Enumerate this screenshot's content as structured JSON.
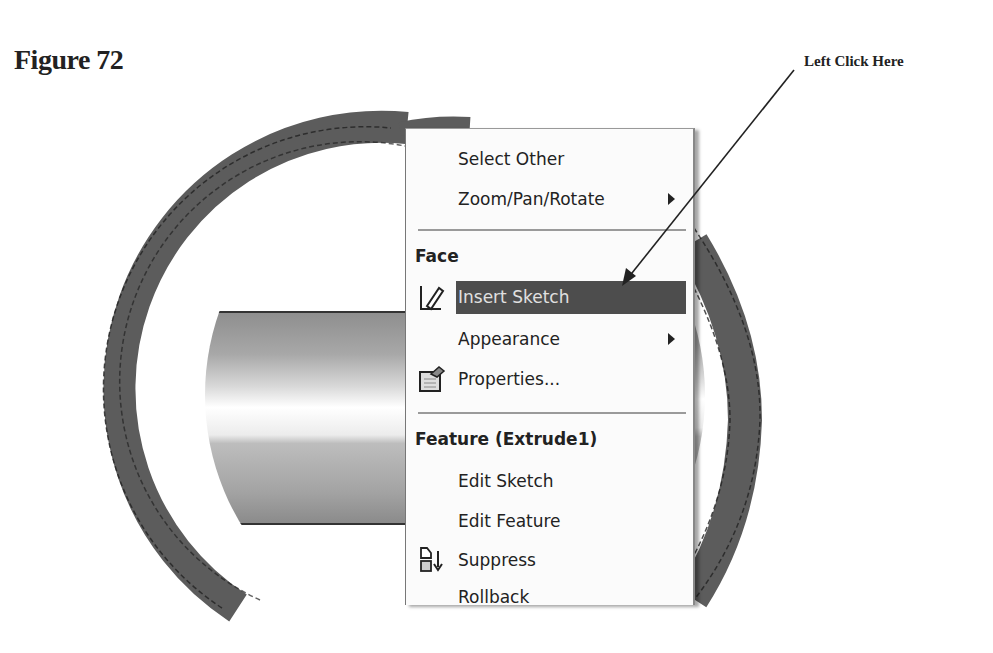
{
  "page": {
    "figure_label": "Figure 72",
    "callout_text": "Left Click Here"
  },
  "context_menu": {
    "items": [
      {
        "label": "Select Other",
        "has_submenu": false
      },
      {
        "label": "Zoom/Pan/Rotate",
        "has_submenu": true
      }
    ],
    "sections": [
      {
        "header": "Face",
        "items": [
          {
            "label": "Insert Sketch",
            "icon": "sketch-pencil-icon",
            "highlighted": true
          },
          {
            "label": "Appearance",
            "has_submenu": true
          },
          {
            "label": "Properties...",
            "icon": "properties-icon"
          }
        ]
      },
      {
        "header": "Feature (Extrude1)",
        "items": [
          {
            "label": "Edit Sketch"
          },
          {
            "label": "Edit Feature"
          },
          {
            "label": "Suppress",
            "icon": "suppress-icon"
          },
          {
            "label": "Rollback",
            "partially_visible": true
          }
        ]
      }
    ]
  },
  "colors": {
    "ring": "#5c5c5c",
    "highlight": "#4d4d4d",
    "menu_bg": "#fbfbfb",
    "text": "#222222"
  }
}
